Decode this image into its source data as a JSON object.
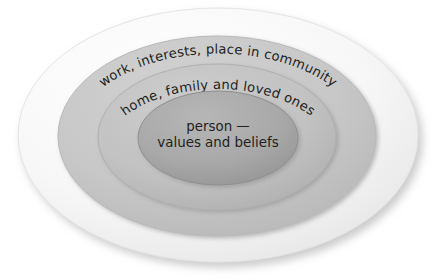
{
  "diagram": {
    "type": "concentric-ellipses",
    "title": "",
    "background_color": "#ffffff",
    "text_color": "#231f20",
    "rings": [
      {
        "id": "outer",
        "name": "wider-world",
        "label": "wider world",
        "fill_color": "#f4f4f4",
        "edge_color": "#e2e2e2",
        "layout": "curved-arc",
        "rx": 200,
        "ry": 127,
        "cx": 218,
        "cy": 135
      },
      {
        "id": "second",
        "name": "work-interests-community",
        "label": "work, interests, place in community",
        "fill_color": "#c7c7c7",
        "edge_color": "#b4b4b4",
        "layout": "curved-arc",
        "rx": 159,
        "ry": 100,
        "cx": 217,
        "cy": 136
      },
      {
        "id": "third",
        "name": "home-family-loved-ones",
        "label": "home, family and loved ones",
        "fill_color": "#c2c2c2",
        "edge_color": "#ababab",
        "layout": "curved-arc",
        "rx": 119,
        "ry": 73,
        "cx": 217,
        "cy": 137
      },
      {
        "id": "inner",
        "name": "person-values-beliefs",
        "label_line_1": "person —",
        "label_line_2": "values and beliefs",
        "fill_color": "#a9a9a9",
        "edge_color": "#8f8f8f",
        "layout": "horizontal-centered",
        "rx": 80,
        "ry": 47,
        "cx": 218,
        "cy": 138
      }
    ],
    "shadow": {
      "present": true,
      "direction": "bottom-right",
      "color": "#d9d9d9"
    }
  }
}
